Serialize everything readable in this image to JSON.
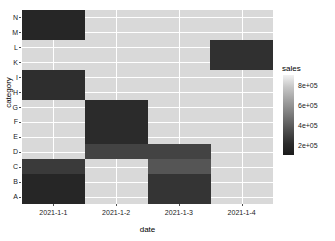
{
  "chart_data": {
    "type": "heatmap",
    "title": "",
    "xlabel": "date",
    "ylabel": "category",
    "x": [
      "2021-1-1",
      "2021-1-2",
      "2021-1-3",
      "2021-1-4"
    ],
    "y": [
      "A",
      "B",
      "C",
      "D",
      "E",
      "F",
      "G",
      "H",
      "I",
      "K",
      "L",
      "M",
      "N"
    ],
    "y_display_order_top_to_bottom": [
      "N",
      "M",
      "L",
      "K",
      "I",
      "H",
      "G",
      "F",
      "E",
      "D",
      "C",
      "B",
      "A"
    ],
    "legend": {
      "title": "sales",
      "position": "right",
      "ticks": [
        "8e+05",
        "6e+05",
        "4e+05",
        "2e+05"
      ],
      "tick_values": [
        800000,
        600000,
        400000,
        200000
      ],
      "scale_min": 100000,
      "scale_max": 900000,
      "low_color": "#132b43",
      "high_color": "#f2f2f2"
    },
    "grid": true,
    "panel_background": "#d9d9d9",
    "gridline_color": "#ffffff",
    "cells": [
      {
        "x": "2021-1-1",
        "y": "N",
        "value": 150000,
        "color": "#262626"
      },
      {
        "x": "2021-1-1",
        "y": "M",
        "value": 150000,
        "color": "#262626"
      },
      {
        "x": "2021-1-1",
        "y": "I",
        "value": 200000,
        "color": "#2e2e2e"
      },
      {
        "x": "2021-1-1",
        "y": "H",
        "value": 200000,
        "color": "#2e2e2e"
      },
      {
        "x": "2021-1-1",
        "y": "C",
        "value": 260000,
        "color": "#3a3a3a"
      },
      {
        "x": "2021-1-1",
        "y": "B",
        "value": 160000,
        "color": "#262626"
      },
      {
        "x": "2021-1-1",
        "y": "A",
        "value": 160000,
        "color": "#262626"
      },
      {
        "x": "2021-1-2",
        "y": "G",
        "value": 180000,
        "color": "#2b2b2b"
      },
      {
        "x": "2021-1-2",
        "y": "F",
        "value": 180000,
        "color": "#2b2b2b"
      },
      {
        "x": "2021-1-2",
        "y": "E",
        "value": 180000,
        "color": "#2b2b2b"
      },
      {
        "x": "2021-1-2",
        "y": "D",
        "value": 300000,
        "color": "#434343"
      },
      {
        "x": "2021-1-3",
        "y": "D",
        "value": 300000,
        "color": "#434343"
      },
      {
        "x": "2021-1-3",
        "y": "C",
        "value": 420000,
        "color": "#555555"
      },
      {
        "x": "2021-1-3",
        "y": "B",
        "value": 230000,
        "color": "#343434"
      },
      {
        "x": "2021-1-3",
        "y": "A",
        "value": 230000,
        "color": "#343434"
      },
      {
        "x": "2021-1-4",
        "y": "L",
        "value": 210000,
        "color": "#303030"
      },
      {
        "x": "2021-1-4",
        "y": "K",
        "value": 210000,
        "color": "#303030"
      }
    ]
  },
  "axes": {
    "x_title": "date",
    "y_title": "category",
    "x_ticks": [
      "2021-1-1",
      "2021-1-2",
      "2021-1-3",
      "2021-1-4"
    ],
    "y_ticks_top_to_bottom": [
      "N",
      "M",
      "L",
      "K",
      "I",
      "H",
      "G",
      "F",
      "E",
      "D",
      "C",
      "B",
      "A"
    ]
  },
  "legend": {
    "title": "sales",
    "labels": [
      "8e+05",
      "6e+05",
      "4e+05",
      "2e+05"
    ]
  }
}
